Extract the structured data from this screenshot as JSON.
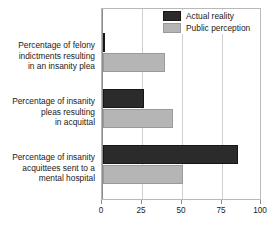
{
  "chart_data": {
    "type": "bar",
    "orientation": "horizontal",
    "title": "",
    "xlabel": "",
    "ylabel": "",
    "xlim": [
      0,
      100
    ],
    "xticks": [
      0,
      25,
      50,
      75,
      100
    ],
    "grid": true,
    "legend_position": "top-right",
    "categories": [
      "Percentage of felony indictments resulting in an insanity plea",
      "Percentage of insanity pleas resulting in acquittal",
      "Percentage of insanity acquittees sent to a mental hospital"
    ],
    "category_lines": [
      [
        "Percentage of felony",
        "indictments resulting",
        "in an insanity plea"
      ],
      [
        "Percentage of insanity",
        "pleas resulting",
        "in acquittal"
      ],
      [
        "Percentage of insanity",
        "acquittees sent to a",
        "mental hospital"
      ]
    ],
    "series": [
      {
        "name": "Actual reality",
        "color": "#2b2b2b",
        "values": [
          1,
          26,
          85
        ]
      },
      {
        "name": "Public perception",
        "color": "#b5b5b5",
        "values": [
          39,
          44,
          50
        ]
      }
    ]
  },
  "colors": {
    "actual_reality": "#2b2b2b",
    "public_perception": "#b5b5b5",
    "grid": "#cfcfcf",
    "axis": "#8a8a8a",
    "text": "#1a1a1a",
    "background": "#ffffff"
  }
}
